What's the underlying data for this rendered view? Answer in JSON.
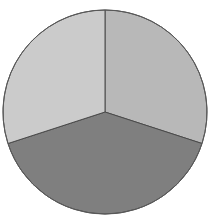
{
  "chart_data": {
    "type": "pie",
    "title": "",
    "categories": [
      "Slice A",
      "Slice B",
      "Slice C"
    ],
    "values": [
      30,
      40,
      30
    ],
    "start_angle_deg": 0,
    "direction": "clockwise",
    "colors": [
      "#b8b8b8",
      "#7f7f7f",
      "#cbcbcb"
    ],
    "legend": "none",
    "labels_shown": false,
    "center": [
      105,
      112
    ],
    "radius": 102,
    "stroke_color": "#4a4a4a"
  }
}
